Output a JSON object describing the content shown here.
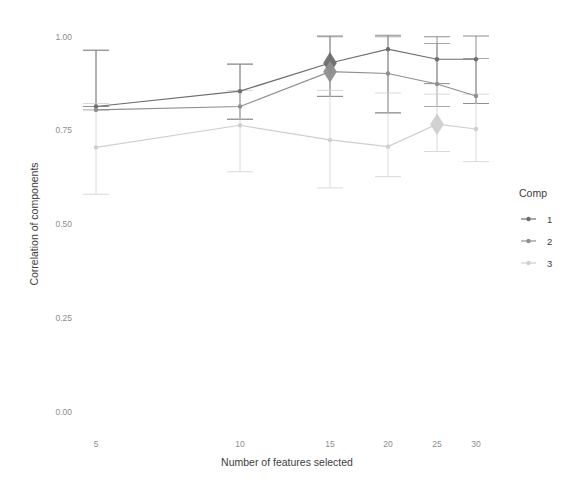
{
  "chart_data": {
    "type": "line",
    "title": "",
    "xlabel": "Number of features selected",
    "ylabel": "Correlation of components",
    "x": [
      5,
      10,
      15,
      20,
      25,
      30
    ],
    "xtick_labels": [
      "5",
      "10",
      "15",
      "20",
      "25",
      "30"
    ],
    "ytick_labels": [
      "0.00",
      "0.25",
      "0.50",
      "0.75",
      "1.00"
    ],
    "yticks": [
      0.0,
      0.25,
      0.5,
      0.75,
      1.0
    ],
    "ylim": [
      0.0,
      1.0
    ],
    "grid": false,
    "legend_title": "Comp",
    "legend_position": "right",
    "error_bars": true,
    "series": [
      {
        "name": "1",
        "color": "#6e6e6e",
        "values": [
          0.812,
          0.853,
          0.928,
          0.965,
          0.938,
          0.938
        ],
        "err_low": [
          0.812,
          0.778,
          0.839,
          0.795,
          0.873,
          0.82
        ],
        "err_high": [
          0.962,
          0.925,
          1.0,
          1.002,
          0.998,
          1.0
        ],
        "highlight_index": 2,
        "highlight_marker": "diamond"
      },
      {
        "name": "2",
        "color": "#8f8f8f",
        "values": [
          0.803,
          0.812,
          0.905,
          0.9,
          0.872,
          0.84
        ],
        "err_low": [
          0.803,
          0.778,
          0.839,
          0.795,
          0.812,
          0.82
        ],
        "err_high": [
          0.962,
          0.925,
          0.998,
          0.998,
          0.98,
          0.94
        ],
        "highlight_index": 2,
        "highlight_marker": "diamond"
      },
      {
        "name": "3",
        "color": "#cfcfcf",
        "values": [
          0.703,
          0.762,
          0.723,
          0.705,
          0.765,
          0.752
        ],
        "err_low": [
          0.578,
          0.638,
          0.595,
          0.625,
          0.692,
          0.665
        ],
        "err_high": [
          0.82,
          0.855,
          0.855,
          0.848,
          0.845,
          0.845
        ],
        "highlight_index": 4,
        "highlight_marker": "diamond"
      }
    ]
  }
}
